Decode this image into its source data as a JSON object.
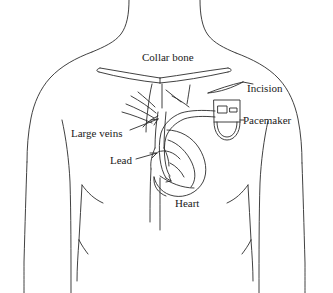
{
  "figure": {
    "style": "black line drawing on white background",
    "colors": {
      "background": "#ffffff",
      "line": "#2b2b2b",
      "text": "#1a1a1a"
    }
  },
  "labels": {
    "collar_bone": "Collar bone",
    "incision": "Incision",
    "pacemaker": "Pacemaker",
    "large_veins": "Large veins",
    "lead": "Lead",
    "heart": "Heart"
  },
  "parts": [
    {
      "name": "torso-outline",
      "label": ""
    },
    {
      "name": "collar-bone",
      "label": "Collar bone"
    },
    {
      "name": "incision",
      "label": "Incision"
    },
    {
      "name": "pacemaker-device",
      "label": "Pacemaker"
    },
    {
      "name": "large-veins",
      "label": "Large veins"
    },
    {
      "name": "lead-wire",
      "label": "Lead"
    },
    {
      "name": "heart",
      "label": "Heart"
    }
  ]
}
